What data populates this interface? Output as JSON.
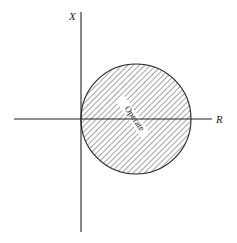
{
  "diagram": {
    "type": "R-X impedance plane relay characteristic",
    "axes": {
      "vertical_label": "X",
      "horizontal_label": "R"
    },
    "region": {
      "shape": "circle",
      "label": "Operate",
      "fill": "hatched",
      "passes_through_origin": true
    },
    "colors": {
      "line": "#222222",
      "background": "#ffffff"
    }
  }
}
